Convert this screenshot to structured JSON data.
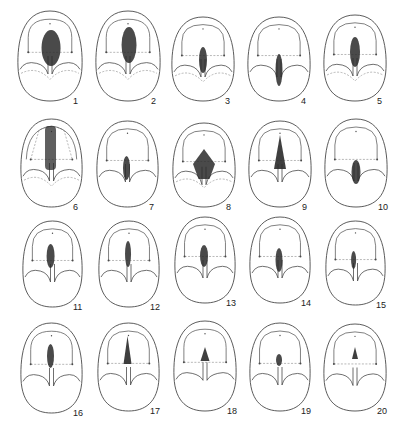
{
  "plate": {
    "stroke_color": "#4a4a4a",
    "dashed_color": "#9a9a9a",
    "shade_color": "#2a2a2a",
    "figures": [
      {
        "label": "1",
        "x": 17,
        "y": 10,
        "w": 66,
        "h": 92,
        "shade": "ellipse",
        "sx": 33,
        "sy": 38,
        "sw": 19,
        "sh": 36,
        "dash_fold": true,
        "arch": "full"
      },
      {
        "label": "2",
        "x": 95,
        "y": 10,
        "w": 66,
        "h": 92,
        "shade": "ellipse",
        "sx": 33,
        "sy": 35,
        "sw": 15,
        "sh": 36,
        "dash_fold": true,
        "arch": "full"
      },
      {
        "label": "3",
        "x": 171,
        "y": 16,
        "w": 64,
        "h": 86,
        "shade": "ellipse",
        "sx": 32,
        "sy": 44,
        "sw": 8,
        "sh": 26,
        "dash_fold": true,
        "arch": "full"
      },
      {
        "label": "4",
        "x": 247,
        "y": 16,
        "w": 64,
        "h": 86,
        "shade": "ellipse",
        "sx": 32,
        "sy": 54,
        "sw": 7,
        "sh": 32,
        "dash_fold": false,
        "arch": "full"
      },
      {
        "label": "5",
        "x": 323,
        "y": 14,
        "w": 64,
        "h": 88,
        "shade": "ellipse",
        "sx": 32,
        "sy": 38,
        "sw": 10,
        "sh": 30,
        "dash_fold": true,
        "arch": "full"
      },
      {
        "label": "6",
        "x": 20,
        "y": 118,
        "w": 63,
        "h": 90,
        "shade": "rect",
        "sx": 31,
        "sy": 30,
        "sw": 11,
        "sh": 44,
        "dash_fold": true,
        "arch": "split"
      },
      {
        "label": "7",
        "x": 96,
        "y": 120,
        "w": 63,
        "h": 88,
        "shade": "ellipse",
        "sx": 31,
        "sy": 48,
        "sw": 7,
        "sh": 24,
        "dash_fold": false,
        "arch": "open"
      },
      {
        "label": "8",
        "x": 172,
        "y": 122,
        "w": 64,
        "h": 86,
        "shade": "diamond",
        "sx": 32,
        "sy": 42,
        "sw": 22,
        "sh": 30,
        "dash_fold": true,
        "arch": "full"
      },
      {
        "label": "9",
        "x": 248,
        "y": 120,
        "w": 64,
        "h": 88,
        "shade": "tri",
        "sx": 32,
        "sy": 32,
        "sw": 12,
        "sh": 34,
        "dash_fold": false,
        "arch": "full"
      },
      {
        "label": "10",
        "x": 324,
        "y": 118,
        "w": 64,
        "h": 90,
        "shade": "ellipse",
        "sx": 32,
        "sy": 54,
        "sw": 9,
        "sh": 24,
        "dash_fold": false,
        "arch": "full"
      },
      {
        "label": "11",
        "x": 22,
        "y": 220,
        "w": 61,
        "h": 88,
        "shade": "ellipse",
        "sx": 30,
        "sy": 36,
        "sw": 8,
        "sh": 24,
        "dash_fold": false,
        "arch": "full"
      },
      {
        "label": "12",
        "x": 98,
        "y": 220,
        "w": 62,
        "h": 88,
        "shade": "ellipse",
        "sx": 31,
        "sy": 34,
        "sw": 6,
        "sh": 26,
        "dash_fold": false,
        "arch": "full"
      },
      {
        "label": "13",
        "x": 174,
        "y": 216,
        "w": 62,
        "h": 88,
        "shade": "ellipse",
        "sx": 31,
        "sy": 40,
        "sw": 8,
        "sh": 22,
        "dash_fold": false,
        "arch": "full"
      },
      {
        "label": "14",
        "x": 249,
        "y": 216,
        "w": 62,
        "h": 88,
        "shade": "ellipse",
        "sx": 31,
        "sy": 44,
        "sw": 7,
        "sh": 24,
        "dash_fold": false,
        "arch": "full"
      },
      {
        "label": "15",
        "x": 325,
        "y": 220,
        "w": 61,
        "h": 86,
        "shade": "ellipse",
        "sx": 30,
        "sy": 40,
        "sw": 5,
        "sh": 18,
        "dash_fold": false,
        "arch": "full"
      },
      {
        "label": "16",
        "x": 20,
        "y": 322,
        "w": 63,
        "h": 92,
        "shade": "ellipse",
        "sx": 31,
        "sy": 34,
        "sw": 7,
        "sh": 24,
        "dash_fold": false,
        "arch": "full"
      },
      {
        "label": "17",
        "x": 97,
        "y": 322,
        "w": 63,
        "h": 90,
        "shade": "tri",
        "sx": 31,
        "sy": 28,
        "sw": 8,
        "sh": 28,
        "dash_fold": false,
        "arch": "full"
      },
      {
        "label": "18",
        "x": 173,
        "y": 320,
        "w": 64,
        "h": 92,
        "shade": "tri",
        "sx": 32,
        "sy": 34,
        "sw": 9,
        "sh": 14,
        "dash_fold": false,
        "arch": "full"
      },
      {
        "label": "19",
        "x": 249,
        "y": 322,
        "w": 62,
        "h": 90,
        "shade": "ellipse",
        "sx": 31,
        "sy": 38,
        "sw": 6,
        "sh": 12,
        "dash_fold": false,
        "arch": "open"
      },
      {
        "label": "20",
        "x": 323,
        "y": 323,
        "w": 64,
        "h": 89,
        "shade": "tri",
        "sx": 32,
        "sy": 30,
        "sw": 6,
        "sh": 12,
        "dash_fold": false,
        "arch": "open"
      }
    ]
  }
}
